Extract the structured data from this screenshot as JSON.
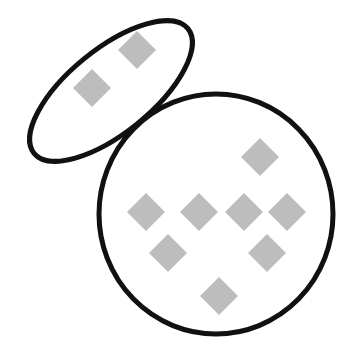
{
  "diagram": {
    "background": "#ffffff",
    "stroke_color": "#111111",
    "item_color": "#bdbdbd",
    "groups": [
      {
        "name": "small-ellipse-group",
        "shape": "ellipse",
        "center": [
          111,
          91
        ],
        "rx": 99,
        "ry": 42,
        "rotation_deg": -39,
        "items": [
          {
            "cx": 137,
            "cy": 50
          },
          {
            "cx": 92,
            "cy": 88
          }
        ]
      },
      {
        "name": "large-circle-group",
        "shape": "circle",
        "center": [
          216,
          214
        ],
        "rx": 117,
        "ry": 120,
        "items": [
          {
            "cx": 260,
            "cy": 157
          },
          {
            "cx": 146,
            "cy": 212
          },
          {
            "cx": 199,
            "cy": 212
          },
          {
            "cx": 244,
            "cy": 212
          },
          {
            "cx": 287,
            "cy": 212
          },
          {
            "cx": 168,
            "cy": 253
          },
          {
            "cx": 267,
            "cy": 253
          },
          {
            "cx": 219,
            "cy": 296
          }
        ]
      }
    ]
  }
}
